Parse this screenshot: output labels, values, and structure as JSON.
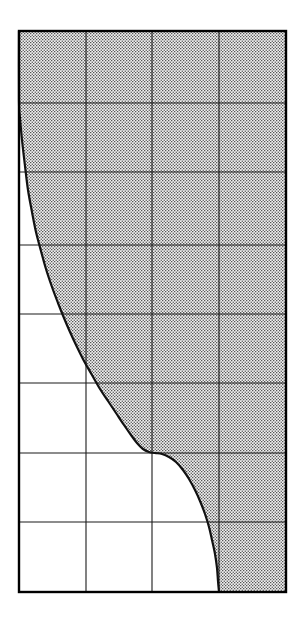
{
  "figure": {
    "background_color": "#ffffff",
    "width": 303,
    "height": 620
  },
  "chart_data": {
    "type": "area",
    "title": "",
    "subtitle": "",
    "xlabel": "",
    "ylabel": "",
    "axes": {
      "grid": true,
      "grid_line_color": "#1a1a1a",
      "frame_color": "#000000",
      "frame_line_width": 2,
      "grid_line_width": 1.1,
      "tick_labels_shown": false,
      "axis_labels_shown": false,
      "legend_shown": false,
      "xlim": [
        0,
        4
      ],
      "ylim": [
        0,
        8
      ],
      "x_major_ticks": [
        0,
        1,
        2,
        3,
        4
      ],
      "y_major_ticks": [
        0,
        1,
        2,
        3,
        4,
        5,
        6,
        7,
        8
      ],
      "x_tick_labels": [
        "",
        "",
        "",
        "",
        ""
      ],
      "y_tick_labels": [
        "",
        "",
        "",
        "",
        "",
        "",
        "",
        "",
        ""
      ],
      "x_gridline_px": [
        19,
        86,
        152,
        219,
        286
      ],
      "y_gridline_px": [
        31,
        103,
        172,
        245,
        314,
        383,
        453,
        522,
        592
      ],
      "plot_left_px": 19,
      "plot_right_px": 286,
      "plot_top_px": 31,
      "plot_bottom_px": 592
    },
    "series": [
      {
        "name": "boundary-curve",
        "line_color": "#111111",
        "line_width": 2.2,
        "points_px": [
          [
            19,
            31
          ],
          [
            19,
            101
          ],
          [
            20,
            118
          ],
          [
            22,
            140
          ],
          [
            25,
            166
          ],
          [
            28,
            190
          ],
          [
            32,
            212
          ],
          [
            36,
            232
          ],
          [
            41,
            251
          ],
          [
            46,
            269
          ],
          [
            52,
            287
          ],
          [
            58,
            303
          ],
          [
            64,
            318
          ],
          [
            70,
            332
          ],
          [
            77,
            347
          ],
          [
            84,
            361
          ],
          [
            92,
            375
          ],
          [
            100,
            389
          ],
          [
            108,
            401
          ],
          [
            116,
            413
          ],
          [
            124,
            425
          ],
          [
            131,
            435
          ],
          [
            137,
            443
          ],
          [
            143,
            449
          ],
          [
            149,
            452
          ],
          [
            155,
            453
          ],
          [
            162,
            454
          ],
          [
            169,
            457
          ],
          [
            176,
            462
          ],
          [
            183,
            470
          ],
          [
            189,
            479
          ],
          [
            195,
            490
          ],
          [
            200,
            501
          ],
          [
            205,
            514
          ],
          [
            209,
            527
          ],
          [
            212,
            540
          ],
          [
            215,
            554
          ],
          [
            217,
            568
          ],
          [
            218,
            581
          ],
          [
            219,
            592
          ]
        ],
        "shape": "reverse-S / double-bend decreasing curve"
      }
    ],
    "fill_regions": [
      {
        "name": "stippled-region",
        "location": "above and to the right of the boundary curve",
        "pattern": "fine dotted / stipple hatch",
        "dot_color": "#4d4d4d",
        "background_color": "#f0f0f0",
        "extends_to": [
          "plot-top",
          "plot-right",
          "plot-bottom"
        ]
      },
      {
        "name": "blank-region",
        "location": "below and to the left of the boundary curve",
        "pattern": "none",
        "background_color": "#ffffff"
      }
    ]
  }
}
